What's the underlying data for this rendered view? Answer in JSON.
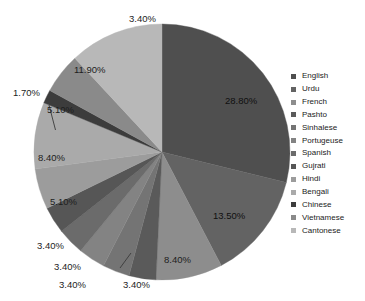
{
  "chart_data": {
    "type": "pie",
    "title": "",
    "start_angle_deg": 0,
    "direction": "clockwise",
    "legend_position": "right",
    "grid": false,
    "categories": [
      "English",
      "Urdu",
      "French",
      "Pashto",
      "Sinhalese",
      "Portugeuse",
      "Spanish",
      "Gujrati",
      "Hindi",
      "Bengali",
      "Chinese",
      "Vietnamese",
      "Cantonese"
    ],
    "values": [
      28.8,
      13.5,
      8.4,
      3.4,
      3.4,
      3.4,
      3.4,
      3.4,
      5.1,
      8.4,
      1.7,
      5.1,
      11.9
    ],
    "value_labels": [
      "28.80%",
      "13.50%",
      "8.40%",
      "3.40%",
      "3.40%",
      "3.40%",
      "3.40%",
      "3.40%",
      "5.10%",
      "8.40%",
      "1.70%",
      "5.10%",
      "11.90%"
    ],
    "colors": [
      "#4f4f4f",
      "#636363",
      "#8d8d8d",
      "#5a5a5a",
      "#747474",
      "#838383",
      "#6b6b6b",
      "#565656",
      "#9c9c9c",
      "#aaaaaa",
      "#3c3c3c",
      "#8a8a8a",
      "#b8b8b8"
    ],
    "unit": "%"
  },
  "legend": {
    "items": [
      {
        "label": "English",
        "color": "#4f4f4f"
      },
      {
        "label": "Urdu",
        "color": "#636363"
      },
      {
        "label": "French",
        "color": "#8d8d8d"
      },
      {
        "label": "Pashto",
        "color": "#5a5a5a"
      },
      {
        "label": "Sinhalese",
        "color": "#747474"
      },
      {
        "label": "Portugeuse",
        "color": "#838383"
      },
      {
        "label": "Spanish",
        "color": "#6b6b6b"
      },
      {
        "label": "Gujrati",
        "color": "#565656"
      },
      {
        "label": "Hindi",
        "color": "#9c9c9c"
      },
      {
        "label": "Bengali",
        "color": "#aaaaaa"
      },
      {
        "label": "Chinese",
        "color": "#3c3c3c"
      },
      {
        "label": "Vietnamese",
        "color": "#8a8a8a"
      },
      {
        "label": "Cantonese",
        "color": "#b8b8b8"
      }
    ]
  },
  "labels": {
    "top_3_4": "3.40%",
    "english_28_8": "28.80%",
    "urdu_13_5": "13.50%",
    "french_8_4": "8.40%",
    "pashto_3_4": "3.40%",
    "sinhalese_3_4": "3.40%",
    "portugeuse_3_4": "3.40%",
    "spanish_3_4": "3.40%",
    "hindi_5_1": "5.10%",
    "bengali_8_4": "8.40%",
    "chinese_1_7": "1.70%",
    "vietnamese_5_1": "5.10%",
    "cantonese_11_9": "11.90%"
  }
}
